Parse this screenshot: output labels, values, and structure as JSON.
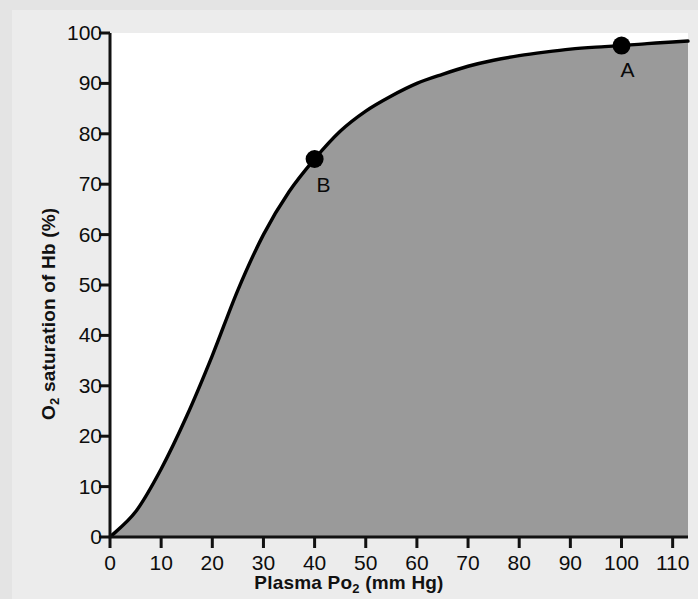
{
  "figure": {
    "kind": "scientific-figure",
    "background_color": "#e4e4e4",
    "panel_color": "#ececec",
    "plot_area_color": "#ffffff"
  },
  "chart_data": {
    "type": "line",
    "title": "",
    "subtitle": "",
    "xlabel": "Plasma Po2 (mm Hg)",
    "xlabel_base": "Plasma Po",
    "xlabel_sub": "2",
    "xlabel_tail": " (mm Hg)",
    "ylabel": "O2 saturation of Hb (%)",
    "ylabel_base": "O",
    "ylabel_sub": "2",
    "ylabel_tail": " saturation of Hb (%)",
    "xlim": [
      0,
      113
    ],
    "ylim": [
      0,
      100
    ],
    "xticks": [
      0,
      10,
      20,
      30,
      40,
      50,
      60,
      70,
      80,
      90,
      100,
      110
    ],
    "yticks": [
      0,
      10,
      20,
      30,
      40,
      50,
      60,
      70,
      80,
      90,
      100
    ],
    "grid": false,
    "legend": "none",
    "fill_under_curve": true,
    "fill_color": "#9a9a9a",
    "line_color": "#000000",
    "line_width": 3,
    "series": [
      {
        "name": "Oxygen-hemoglobin dissociation curve",
        "x": [
          0,
          5,
          10,
          15,
          20,
          25,
          30,
          35,
          40,
          45,
          50,
          55,
          60,
          65,
          70,
          75,
          80,
          85,
          90,
          95,
          100,
          105,
          110,
          113
        ],
        "y": [
          0,
          5,
          13.5,
          24,
          36,
          49,
          60,
          68.5,
          75,
          80.5,
          84.5,
          87.5,
          90,
          91.8,
          93.4,
          94.6,
          95.5,
          96.2,
          96.8,
          97.2,
          97.5,
          97.9,
          98.2,
          98.4
        ]
      }
    ],
    "annotations": [
      {
        "label": "A",
        "x": 100,
        "y": 97.5,
        "marker": "filled-circle",
        "label_dx": 6,
        "label_dy": 26
      },
      {
        "label": "B",
        "x": 40,
        "y": 75,
        "marker": "filled-circle",
        "label_dx": 9,
        "label_dy": 28
      }
    ]
  },
  "axes": {
    "x_tick_labels": [
      "0",
      "10",
      "20",
      "30",
      "40",
      "50",
      "60",
      "70",
      "80",
      "90",
      "100",
      "110"
    ],
    "y_tick_labels": [
      "0",
      "10",
      "20",
      "30",
      "40",
      "50",
      "60",
      "70",
      "80",
      "90",
      "100"
    ]
  }
}
